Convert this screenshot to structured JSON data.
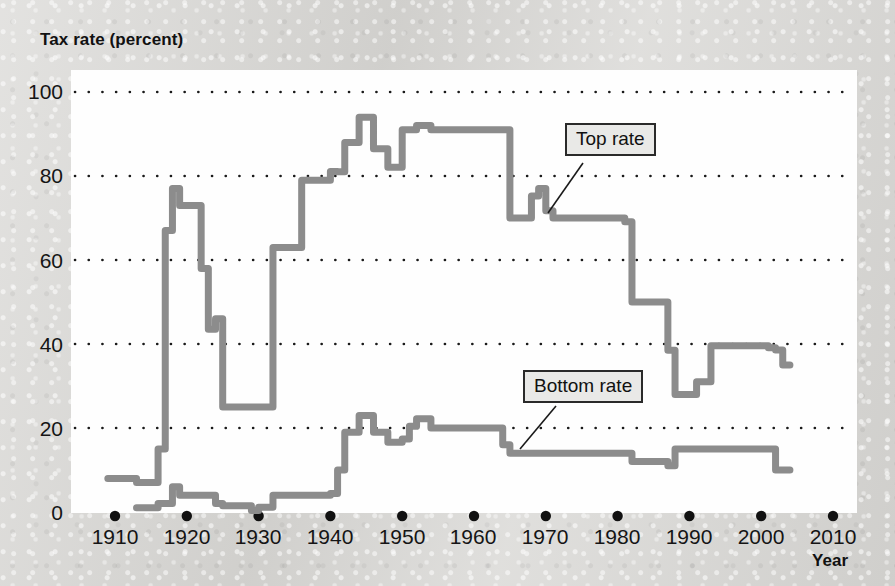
{
  "figure": {
    "y_axis_title": "Tax rate (percent)",
    "x_axis_title": "Year",
    "background_color": "#d7d6d3",
    "plot_background_color": "#fefefe",
    "series_color": "#8c8c8c",
    "gridline_color": "#1a1a1a",
    "callout_top_label": "Top rate",
    "callout_bottom_label": "Bottom rate"
  },
  "axes": {
    "y_ticks": [
      "0",
      "20",
      "40",
      "60",
      "80",
      "100"
    ],
    "x_ticks": [
      "1910",
      "1920",
      "1930",
      "1940",
      "1950",
      "1960",
      "1970",
      "1980",
      "1990",
      "2000",
      "2010"
    ]
  },
  "chart_data": {
    "type": "line",
    "title": "",
    "xlabel": "Year",
    "ylabel": "Tax rate (percent)",
    "xlim": [
      1908,
      2012
    ],
    "ylim": [
      0,
      100
    ],
    "ytick_values": [
      0,
      20,
      40,
      60,
      80,
      100
    ],
    "xtick_values": [
      1910,
      1920,
      1930,
      1940,
      1950,
      1960,
      1970,
      1980,
      1990,
      2000,
      2010
    ],
    "grid": "horizontal-dotted",
    "legend": "inline-callout-labels",
    "annotations": [
      {
        "text": "Top rate",
        "points_to_year": 1975,
        "points_to_value": 70
      },
      {
        "text": "Bottom rate",
        "points_to_year": 1972,
        "points_to_value": 14
      }
    ],
    "series": [
      {
        "name": "Top rate",
        "x": [
          1909,
          1912,
          1913,
          1915,
          1916,
          1917,
          1918,
          1919,
          1921,
          1922,
          1923,
          1924,
          1925,
          1929,
          1930,
          1931,
          1932,
          1935,
          1936,
          1939,
          1940,
          1941,
          1942,
          1944,
          1946,
          1948,
          1950,
          1951,
          1952,
          1954,
          1964,
          1965,
          1968,
          1969,
          1970,
          1971,
          1981,
          1982,
          1987,
          1988,
          1990,
          1991,
          1992,
          1993,
          2001,
          2002,
          2003,
          2004
        ],
        "y": [
          8,
          8,
          7,
          7,
          15,
          67,
          77,
          73,
          73,
          58,
          43.5,
          46,
          25,
          25,
          25,
          25,
          63,
          63,
          79,
          79,
          81.1,
          81,
          88,
          94,
          86.5,
          82.1,
          91,
          91,
          92,
          91,
          91,
          70,
          75.25,
          77,
          71.75,
          70,
          69.125,
          50,
          38.5,
          28,
          28,
          31,
          31,
          39.6,
          39.1,
          38.6,
          35,
          35
        ]
      },
      {
        "name": "Bottom rate",
        "x": [
          1913,
          1916,
          1917,
          1918,
          1919,
          1922,
          1924,
          1925,
          1929,
          1930,
          1932,
          1934,
          1936,
          1940,
          1941,
          1942,
          1944,
          1946,
          1948,
          1950,
          1951,
          1952,
          1954,
          1964,
          1965,
          1971,
          1979,
          1982,
          1987,
          1988,
          1991,
          2001,
          2002,
          2003,
          2004
        ],
        "y": [
          1,
          2,
          2,
          6,
          4,
          4,
          2,
          1.5,
          0.375,
          1.125,
          4,
          4,
          4,
          4.4,
          10,
          19,
          23,
          19,
          16.6,
          17.4,
          20.4,
          22.2,
          20,
          16,
          14,
          14,
          14,
          12,
          11,
          15,
          15,
          15,
          10,
          10,
          10
        ]
      }
    ]
  }
}
